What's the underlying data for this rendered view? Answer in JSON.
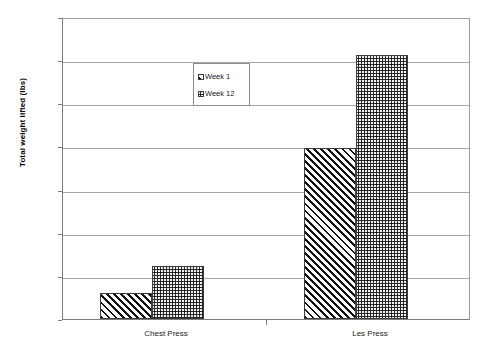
{
  "chart_data": {
    "type": "bar",
    "title": "",
    "xlabel": "",
    "ylabel": "Total weight lifted (lbs)",
    "categories": [
      "Chest Press",
      "Les Press"
    ],
    "series": [
      {
        "name": "Week 1",
        "values": [
          30,
          200
        ]
      },
      {
        "name": "Week 12",
        "values": [
          62,
          308
        ]
      }
    ],
    "ylim": [
      0,
      350
    ],
    "ytick_labels": [
      "0",
      "50",
      "100",
      "150",
      "200",
      "250",
      "300",
      "350"
    ],
    "ytick_values": [
      0,
      50,
      100,
      150,
      200,
      250,
      300,
      350
    ],
    "grid": true,
    "legend_position": "inside-upper-left",
    "series_patterns": [
      "diagonal-hatch",
      "fine-speckle"
    ],
    "colors": {
      "plot_background": "#ffffff",
      "gridline": "#a6a6a6",
      "axis_line": "#7d7d7d",
      "bar_outline": "#3c3c3c",
      "text": "#1a1a1a"
    }
  }
}
